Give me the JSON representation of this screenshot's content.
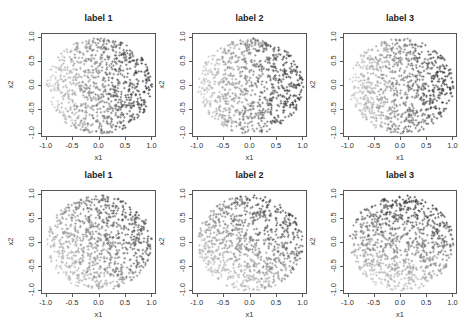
{
  "chart_data": [
    {
      "type": "scatter",
      "row": 1,
      "title": "label 1",
      "xlabel": "x1",
      "ylabel": "x2",
      "xlim": [
        -1,
        1
      ],
      "ylim": [
        -1,
        1
      ],
      "xticks": [
        "-1.0",
        "-0.5",
        "0.0",
        "0.5",
        "1.0"
      ],
      "yticks": [
        "-1.0",
        "-0.5",
        "0.0",
        "0.5",
        "1.0"
      ],
      "marker": "+",
      "points_region": "unit disk",
      "n_points_approx": 900,
      "shading": "light gray on left (x1<0), dark gray on right (x1>0)"
    },
    {
      "type": "scatter",
      "row": 1,
      "title": "label 2",
      "xlabel": "x1",
      "ylabel": "x2",
      "xlim": [
        -1,
        1
      ],
      "ylim": [
        -1,
        1
      ],
      "xticks": [
        "-1.0",
        "-0.5",
        "0.0",
        "0.5",
        "1.0"
      ],
      "yticks": [
        "-1.0",
        "-0.5",
        "0.0",
        "0.5",
        "1.0"
      ],
      "marker": "+",
      "points_region": "unit disk",
      "n_points_approx": 900,
      "shading": "light gray on left (x1<0), dark gray on right (x1>0)"
    },
    {
      "type": "scatter",
      "row": 1,
      "title": "label 3",
      "xlabel": "x1",
      "ylabel": "x2",
      "xlim": [
        -1,
        1
      ],
      "ylim": [
        -1,
        1
      ],
      "xticks": [
        "-1.0",
        "-0.5",
        "0.0",
        "0.5",
        "1.0"
      ],
      "yticks": [
        "-1.0",
        "-0.5",
        "0.0",
        "0.5",
        "1.0"
      ],
      "marker": "+",
      "points_region": "unit disk",
      "n_points_approx": 900,
      "shading": "light gray on left (x1<0), dark gray on right (x1>0)"
    },
    {
      "type": "scatter",
      "row": 2,
      "title": "label 1",
      "xlabel": "x1",
      "ylabel": "x2",
      "xlim": [
        -1,
        1
      ],
      "ylim": [
        -1,
        1
      ],
      "xticks": [
        "-1.0",
        "-0.5",
        "0.0",
        "0.5",
        "1.0"
      ],
      "yticks": [
        "-1.0",
        "-0.5",
        "0.0",
        "0.5",
        "1.0"
      ],
      "marker": "+",
      "points_region": "unit disk",
      "n_points_approx": 900,
      "shading": "dark in upper-right and right-middle, light in lower-left"
    },
    {
      "type": "scatter",
      "row": 2,
      "title": "label 2",
      "xlabel": "x1",
      "ylabel": "x2",
      "xlim": [
        -1,
        1
      ],
      "ylim": [
        -1,
        1
      ],
      "xticks": [
        "-1.0",
        "-0.5",
        "0.0",
        "0.5",
        "1.0"
      ],
      "yticks": [
        "-1.0",
        "-0.5",
        "0.0",
        "0.5",
        "1.0"
      ],
      "marker": "+",
      "points_region": "unit disk",
      "n_points_approx": 900,
      "shading": "dark in upper area and right, light in lower-left"
    },
    {
      "type": "scatter",
      "row": 2,
      "title": "label 3",
      "xlabel": "x1",
      "ylabel": "x2",
      "xlim": [
        -1,
        1
      ],
      "ylim": [
        -1,
        1
      ],
      "xticks": [
        "-1.0",
        "-0.5",
        "0.0",
        "0.5",
        "1.0"
      ],
      "yticks": [
        "-1.0",
        "-0.5",
        "0.0",
        "0.5",
        "1.0"
      ],
      "marker": "+",
      "points_region": "unit disk",
      "n_points_approx": 900,
      "shading": "dark in upper half, light in lower half"
    }
  ],
  "colors": {
    "dark": "#3a3a3a",
    "light": "#c8c8c8",
    "axis": "#555555"
  }
}
